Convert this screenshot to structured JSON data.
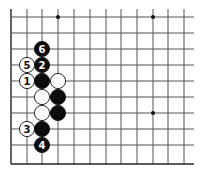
{
  "diagram": {
    "type": "go-board-fragment",
    "grid": {
      "cols_x": [
        11,
        27,
        42,
        58,
        74,
        90,
        106,
        121,
        137,
        153,
        168,
        184
      ],
      "rows_y": [
        17,
        33,
        49,
        65,
        81,
        97,
        113,
        129,
        145,
        164
      ],
      "top_open_y": 9,
      "right_open_x": 194,
      "line_color": "#555555",
      "edge_color": "#222222"
    },
    "star_points": [
      {
        "col": 3,
        "row": 0
      },
      {
        "col": 9,
        "row": 0
      },
      {
        "col": 9,
        "row": 6
      }
    ],
    "stones": [
      {
        "color": "black",
        "col": 2,
        "row": 2,
        "label": "6"
      },
      {
        "color": "black",
        "col": 2,
        "row": 3,
        "label": "2"
      },
      {
        "color": "white",
        "col": 1,
        "row": 3,
        "label": "5"
      },
      {
        "color": "white",
        "col": 1,
        "row": 4,
        "label": "1"
      },
      {
        "color": "black",
        "col": 2,
        "row": 4,
        "label": ""
      },
      {
        "color": "white",
        "col": 3,
        "row": 4,
        "label": ""
      },
      {
        "color": "white",
        "col": 2,
        "row": 5,
        "label": ""
      },
      {
        "color": "black",
        "col": 3,
        "row": 5,
        "label": ""
      },
      {
        "color": "white",
        "col": 2,
        "row": 6,
        "label": ""
      },
      {
        "color": "black",
        "col": 3,
        "row": 6,
        "label": ""
      },
      {
        "color": "white",
        "col": 1,
        "row": 7,
        "label": "3"
      },
      {
        "color": "black",
        "col": 2,
        "row": 7,
        "label": ""
      },
      {
        "color": "black",
        "col": 2,
        "row": 8,
        "label": "4"
      }
    ]
  }
}
